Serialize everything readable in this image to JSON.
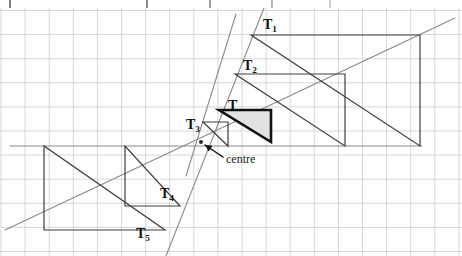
{
  "figure": {
    "title_alt": "Enlargement of triangle T by several scale factors about a common centre",
    "background": "#ffffff",
    "grid": {
      "spacing": 24.1,
      "origin_x": 1.0,
      "origin_y": 10.5,
      "color": "#c9cfd6",
      "line_width": 0.8,
      "visible": true
    },
    "table_strip": {
      "visible": true,
      "top": 0,
      "height": 8,
      "left": 10,
      "right": 462,
      "border_color": "#3a3a3a",
      "divider_x": [
        147,
        210,
        272,
        330
      ],
      "cells": [
        "",
        "",
        "",
        "",
        ""
      ]
    }
  },
  "centre": {
    "label": "centre",
    "x": 201,
    "y": 142,
    "marker": "dot",
    "arrow_from_x": 223,
    "arrow_from_y": 157,
    "arrow_to_x": 205,
    "arrow_to_y": 145
  },
  "rays": {
    "color": "#8a8a8a",
    "width": 1.1,
    "lines": [
      {
        "name": "ray-through-apex",
        "x1": 236,
        "y1": 14,
        "x2": 186,
        "y2": 176
      },
      {
        "name": "ray-through-right-angle-corner",
        "x1": 5,
        "y1": 230,
        "x2": 455,
        "y2": 18
      },
      {
        "name": "ray-through-base-right",
        "x1": 10,
        "y1": 146,
        "x2": 422,
        "y2": 146
      },
      {
        "name": "ray-through-bottom-vertex",
        "x1": 166,
        "y1": 256,
        "x2": 264,
        "y2": 8
      }
    ]
  },
  "triangles": [
    {
      "id": "T",
      "label": "T",
      "label_x": 228,
      "label_y": 98,
      "stroke": "#111111",
      "stroke_width": 2.6,
      "fill": "#e2e2e2",
      "fill_opacity": 1,
      "shaded": true,
      "points": "219,110 271,110 271,142",
      "scale_factor": 1,
      "description": "original shaded triangle, right angle at top-left"
    },
    {
      "id": "T1",
      "label": "T",
      "sub": "1",
      "label_x": 263,
      "label_y": 17,
      "stroke": "#3f3f3f",
      "stroke_width": 1.2,
      "fill": "none",
      "shaded": false,
      "points": "251,35 420,35 420,146",
      "scale_factor": 3.3,
      "description": "largest enlargement, top right"
    },
    {
      "id": "T2",
      "label": "T",
      "sub": "2",
      "label_x": 243,
      "label_y": 58,
      "stroke": "#3f3f3f",
      "stroke_width": 1.2,
      "fill": "none",
      "shaded": false,
      "points": "235,74 345,74 345,146",
      "scale_factor": 2.2,
      "description": "medium enlargement, upper right"
    },
    {
      "id": "T3",
      "label": "T",
      "sub": "3",
      "label_x": 186,
      "label_y": 117,
      "stroke": "#3f3f3f",
      "stroke_width": 1.2,
      "fill": "none",
      "shaded": false,
      "points": "203,122 228,122 228,146",
      "scale_factor": 0.5,
      "description": "small reduction just above the centre"
    },
    {
      "id": "T4",
      "label": "T",
      "sub": "4",
      "label_x": 160,
      "label_y": 186,
      "stroke": "#3f3f3f",
      "stroke_width": 1.2,
      "fill": "none",
      "shaded": false,
      "points": "125,146 125,206 180,206",
      "scale_factor": -1.1,
      "description": "negative-scale image, inverted, lower middle"
    },
    {
      "id": "T5",
      "label": "T",
      "sub": "5",
      "label_x": 136,
      "label_y": 226,
      "stroke": "#3f3f3f",
      "stroke_width": 1.2,
      "fill": "none",
      "shaded": false,
      "points": "44,146 44,230 165,230",
      "scale_factor": -2.4,
      "description": "negative-scale image, inverted, lower left, largest"
    }
  ],
  "annotations": [
    {
      "name": "centre-callout",
      "text": "centre",
      "x": 226,
      "y": 152
    }
  ],
  "colors": {
    "ink": "#111111",
    "grid": "#c9cfd6",
    "ray": "#8a8a8a",
    "shade": "#e2e2e2",
    "table_border": "#3a3a3a"
  }
}
